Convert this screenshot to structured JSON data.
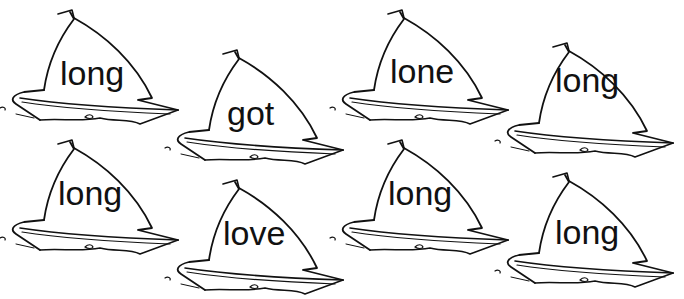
{
  "worksheet": {
    "boats": [
      {
        "word": "long",
        "x": 0,
        "y": 0
      },
      {
        "word": "got",
        "x": 165,
        "y": 40
      },
      {
        "word": "lone",
        "x": 330,
        "y": 0
      },
      {
        "word": "long",
        "x": 495,
        "y": 33
      },
      {
        "word": "long",
        "x": 0,
        "y": 130
      },
      {
        "word": "love",
        "x": 165,
        "y": 170
      },
      {
        "word": "long",
        "x": 330,
        "y": 130
      },
      {
        "word": "long",
        "x": 495,
        "y": 163
      }
    ],
    "colors": {
      "ink": "#111111",
      "paper": "#ffffff"
    }
  }
}
